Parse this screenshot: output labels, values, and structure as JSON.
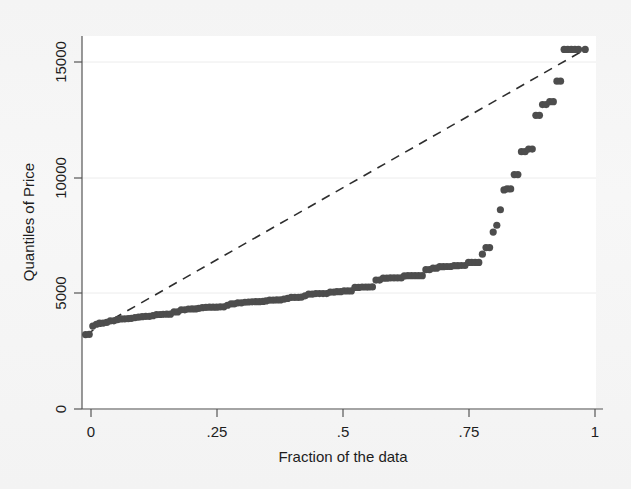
{
  "figure": {
    "kind": "stata-quantile-plot",
    "background_color": "#f4f4f4",
    "plot_background_color": "#ffffff"
  },
  "axes": {
    "x": {
      "title": "Fraction of the data",
      "ticks": [
        "0",
        ".25",
        ".5",
        ".75",
        "1"
      ],
      "tick_values": [
        0,
        0.25,
        0.5,
        0.75,
        1
      ],
      "range": [
        0,
        1
      ]
    },
    "y": {
      "title": "Quantiles of Price",
      "ticks": [
        "0",
        "5000",
        "10000",
        "15000"
      ],
      "tick_values": [
        0,
        5000,
        10000,
        15000
      ],
      "range": [
        0,
        16500
      ]
    }
  },
  "style": {
    "marker_color": "#4d4d4d",
    "marker_radius": 3.6,
    "reference_line_color": "#2e2e2e",
    "gridline_color": "#e8e8e8",
    "axis_color": "#4a4a4a"
  },
  "chart_data": {
    "type": "scatter",
    "title": "",
    "xlabel": "Fraction of the data",
    "ylabel": "Quantiles of Price",
    "xlim": [
      0,
      1
    ],
    "ylim": [
      0,
      16500
    ],
    "grid": true,
    "legend": "none",
    "series": [
      {
        "name": "Quantiles of Price",
        "marker": "filled-circle",
        "color": "#4d4d4d",
        "points": [
          [
            0.007,
            3291
          ],
          [
            0.014,
            3299
          ],
          [
            0.021,
            3667
          ],
          [
            0.028,
            3748
          ],
          [
            0.034,
            3798
          ],
          [
            0.041,
            3799
          ],
          [
            0.048,
            3829
          ],
          [
            0.055,
            3895
          ],
          [
            0.062,
            3900
          ],
          [
            0.069,
            3955
          ],
          [
            0.076,
            3984
          ],
          [
            0.083,
            3985
          ],
          [
            0.09,
            3995
          ],
          [
            0.096,
            4010
          ],
          [
            0.103,
            4042
          ],
          [
            0.11,
            4060
          ],
          [
            0.117,
            4082
          ],
          [
            0.124,
            4099
          ],
          [
            0.131,
            4100
          ],
          [
            0.138,
            4129
          ],
          [
            0.145,
            4172
          ],
          [
            0.152,
            4181
          ],
          [
            0.158,
            4187
          ],
          [
            0.165,
            4195
          ],
          [
            0.172,
            4195
          ],
          [
            0.179,
            4296
          ],
          [
            0.186,
            4296
          ],
          [
            0.193,
            4389
          ],
          [
            0.2,
            4389
          ],
          [
            0.207,
            4424
          ],
          [
            0.214,
            4425
          ],
          [
            0.221,
            4425
          ],
          [
            0.227,
            4453
          ],
          [
            0.234,
            4482
          ],
          [
            0.241,
            4499
          ],
          [
            0.248,
            4504
          ],
          [
            0.255,
            4504
          ],
          [
            0.262,
            4504
          ],
          [
            0.269,
            4516
          ],
          [
            0.276,
            4518
          ],
          [
            0.283,
            4589
          ],
          [
            0.29,
            4647
          ],
          [
            0.296,
            4647
          ],
          [
            0.303,
            4697
          ],
          [
            0.31,
            4697
          ],
          [
            0.317,
            4723
          ],
          [
            0.324,
            4733
          ],
          [
            0.331,
            4741
          ],
          [
            0.338,
            4749
          ],
          [
            0.345,
            4749
          ],
          [
            0.352,
            4758
          ],
          [
            0.358,
            4782
          ],
          [
            0.365,
            4816
          ],
          [
            0.372,
            4816
          ],
          [
            0.379,
            4823
          ],
          [
            0.386,
            4827
          ],
          [
            0.393,
            4858
          ],
          [
            0.4,
            4890
          ],
          [
            0.407,
            4934
          ],
          [
            0.414,
            4934
          ],
          [
            0.421,
            4941
          ],
          [
            0.427,
            4950
          ],
          [
            0.434,
            5005
          ],
          [
            0.441,
            5079
          ],
          [
            0.448,
            5079
          ],
          [
            0.455,
            5104
          ],
          [
            0.462,
            5104
          ],
          [
            0.469,
            5104
          ],
          [
            0.476,
            5104
          ],
          [
            0.483,
            5172
          ],
          [
            0.49,
            5172
          ],
          [
            0.496,
            5189
          ],
          [
            0.503,
            5189
          ],
          [
            0.51,
            5222
          ],
          [
            0.517,
            5222
          ],
          [
            0.524,
            5222
          ],
          [
            0.531,
            5379
          ],
          [
            0.538,
            5379
          ],
          [
            0.545,
            5397
          ],
          [
            0.552,
            5397
          ],
          [
            0.558,
            5397
          ],
          [
            0.565,
            5399
          ],
          [
            0.572,
            5705
          ],
          [
            0.579,
            5705
          ],
          [
            0.586,
            5788
          ],
          [
            0.593,
            5788
          ],
          [
            0.6,
            5799
          ],
          [
            0.607,
            5799
          ],
          [
            0.614,
            5799
          ],
          [
            0.621,
            5799
          ],
          [
            0.627,
            5886
          ],
          [
            0.634,
            5899
          ],
          [
            0.641,
            5899
          ],
          [
            0.648,
            5899
          ],
          [
            0.655,
            5899
          ],
          [
            0.662,
            5899
          ],
          [
            0.669,
            6165
          ],
          [
            0.676,
            6165
          ],
          [
            0.683,
            6229
          ],
          [
            0.69,
            6229
          ],
          [
            0.696,
            6295
          ],
          [
            0.703,
            6295
          ],
          [
            0.71,
            6303
          ],
          [
            0.717,
            6303
          ],
          [
            0.724,
            6342
          ],
          [
            0.731,
            6342
          ],
          [
            0.738,
            6348
          ],
          [
            0.745,
            6348
          ],
          [
            0.752,
            6486
          ],
          [
            0.758,
            6486
          ],
          [
            0.765,
            6486
          ],
          [
            0.772,
            6486
          ],
          [
            0.779,
            6850
          ],
          [
            0.786,
            7140
          ],
          [
            0.793,
            7140
          ],
          [
            0.8,
            7827
          ],
          [
            0.807,
            8129
          ],
          [
            0.814,
            8814
          ],
          [
            0.821,
            9690
          ],
          [
            0.827,
            9735
          ],
          [
            0.834,
            9735
          ],
          [
            0.841,
            10372
          ],
          [
            0.848,
            10372
          ],
          [
            0.855,
            11385
          ],
          [
            0.862,
            11385
          ],
          [
            0.869,
            11497
          ],
          [
            0.876,
            11497
          ],
          [
            0.883,
            12990
          ],
          [
            0.89,
            12990
          ],
          [
            0.896,
            13466
          ],
          [
            0.903,
            13466
          ],
          [
            0.91,
            13594
          ],
          [
            0.917,
            13594
          ],
          [
            0.924,
            14500
          ],
          [
            0.931,
            14500
          ],
          [
            0.938,
            15906
          ],
          [
            0.945,
            15906
          ],
          [
            0.952,
            15906
          ],
          [
            0.959,
            15906
          ],
          [
            0.966,
            15906
          ],
          [
            0.979,
            15906
          ]
        ]
      }
    ],
    "reference_line": {
      "name": "45-degree reference line",
      "style": "dashed",
      "color": "#2e2e2e",
      "from": [
        0.007,
        3291
      ],
      "to": [
        0.979,
        15906
      ]
    }
  }
}
